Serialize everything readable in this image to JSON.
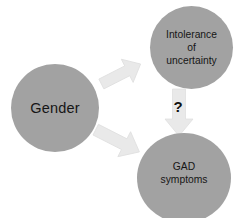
{
  "diagram": {
    "background_color": "#ffffff",
    "node_fill_color": "#a2a2a2",
    "node_text_color": "#161616",
    "arrow_fill_color": "#e8e8e8",
    "arrow_outline_color": "#dcdcdc",
    "nodes": [
      {
        "id": "gender",
        "label": "Gender",
        "shape": "circle",
        "role": "predictor"
      },
      {
        "id": "intolerance-of-uncertainty",
        "label": "Intolerance\nof\nuncertainty",
        "shape": "circle",
        "role": "mediator"
      },
      {
        "id": "gad-symptoms",
        "label": "GAD\nsymptoms",
        "shape": "circle",
        "role": "outcome"
      }
    ],
    "arrows": [
      {
        "id": "gender-to-intolerance",
        "from": "gender",
        "to": "intolerance-of-uncertainty",
        "direction": "up-right",
        "label": ""
      },
      {
        "id": "gender-to-gad",
        "from": "gender",
        "to": "gad-symptoms",
        "direction": "down-right",
        "label": ""
      },
      {
        "id": "intolerance-to-gad",
        "from": "intolerance-of-uncertainty",
        "to": "gad-symptoms",
        "direction": "down",
        "label": "?"
      }
    ],
    "annotations": [
      {
        "id": "unknown-path-marker",
        "text": "?"
      }
    ]
  }
}
